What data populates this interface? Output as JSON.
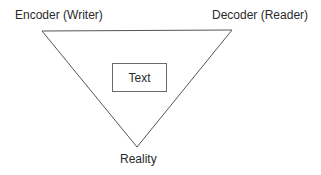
{
  "diagram": {
    "type": "semiotic-triangle",
    "vertices": {
      "top_left": {
        "label": "Encoder (Writer)",
        "x": 42,
        "y": 31
      },
      "top_right": {
        "label": "Decoder (Reader)",
        "x": 232,
        "y": 30
      },
      "bottom": {
        "label": "Reality",
        "x": 137,
        "y": 147
      }
    },
    "center_box": {
      "label": "Text"
    },
    "colors": {
      "stroke": "#555555",
      "text": "#2a2a2a",
      "background": "#ffffff"
    }
  }
}
